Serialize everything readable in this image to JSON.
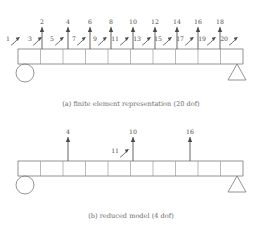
{
  "figure": {
    "panels": [
      {
        "id": "panel-a",
        "caption": "(a)  finite element representation (20 dof)",
        "model_label": "finite element representation",
        "dof_count": "20 dof",
        "beam": {
          "cells": 10,
          "left_support": "roller-circle",
          "right_support": "pinned-triangle",
          "x_start": 18,
          "x_end": 243,
          "y_top": 49,
          "y_bottom": 64
        },
        "translation_dofs": [
          {
            "label": "2",
            "x": 42
          },
          {
            "label": "4",
            "x": 68
          },
          {
            "label": "6",
            "x": 90
          },
          {
            "label": "8",
            "x": 111
          },
          {
            "label": "10",
            "x": 133
          },
          {
            "label": "12",
            "x": 155
          },
          {
            "label": "14",
            "x": 177
          },
          {
            "label": "16",
            "x": 198
          },
          {
            "label": "18",
            "x": 220
          }
        ],
        "rotation_dofs": [
          {
            "label": "1",
            "x": 18
          },
          {
            "label": "3",
            "x": 40
          },
          {
            "label": "5",
            "x": 62
          },
          {
            "label": "7",
            "x": 84
          },
          {
            "label": "9",
            "x": 105
          },
          {
            "label": "11",
            "x": 127
          },
          {
            "label": "13",
            "x": 149
          },
          {
            "label": "15",
            "x": 170
          },
          {
            "label": "17",
            "x": 192
          },
          {
            "label": "19",
            "x": 214
          },
          {
            "label": "20",
            "x": 236
          }
        ]
      },
      {
        "id": "panel-b",
        "caption": "(b)  reduced model (4 dof)",
        "model_label": "reduced model",
        "dof_count": "4 dof",
        "beam": {
          "cells": 10,
          "left_support": "roller-circle",
          "right_support": "pinned-triangle",
          "x_start": 18,
          "x_end": 243,
          "y_top": 161,
          "y_bottom": 176
        },
        "translation_dofs": [
          {
            "label": "4",
            "x": 68
          },
          {
            "label": "10",
            "x": 133
          },
          {
            "label": "16",
            "x": 190
          }
        ],
        "rotation_dofs": [
          {
            "label": "11",
            "x": 127
          }
        ]
      }
    ]
  },
  "colors": {
    "background": "#ffffff",
    "ink": "#4a4a4a",
    "beam_stroke": "#6f6f6f",
    "divider_stroke": "#8d8d8d",
    "caption": "#6a6a6a"
  },
  "captions": {
    "a": "(a)  finite element representation (20 dof)",
    "b": "(b)  reduced model (4 dof)"
  }
}
